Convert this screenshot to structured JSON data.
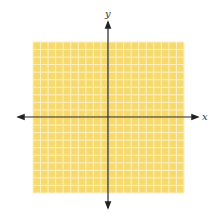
{
  "diagram": {
    "type": "coordinate-plane",
    "grid": {
      "columns": 20,
      "rows": 20,
      "x": 33,
      "y": 42,
      "width": 151,
      "height": 151,
      "fill_color": "#F6DA6E",
      "line_color": "#FCF0C4"
    },
    "axes": {
      "origin_x": 108,
      "origin_y": 117,
      "color": "#222222",
      "x_axis": {
        "label": "x",
        "start": 18,
        "end": 198
      },
      "y_axis": {
        "label": "y",
        "start": 22,
        "end": 208
      }
    }
  }
}
